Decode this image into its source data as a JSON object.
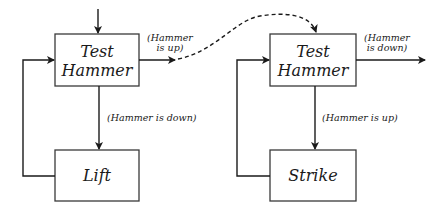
{
  "diagram": {
    "left": {
      "test_box": {
        "line1": "Test",
        "line2": "Hammer"
      },
      "action_box": {
        "label": "Lift"
      },
      "exit_label": {
        "line1": "(Hammer",
        "line2": "is up)"
      },
      "down_label": "(Hammer is down)"
    },
    "right": {
      "test_box": {
        "line1": "Test",
        "line2": "Hammer"
      },
      "action_box": {
        "label": "Strike"
      },
      "exit_label": {
        "line1": "(Hammer",
        "line2": "is down)"
      },
      "down_label": "(Hammer is up)"
    },
    "colors": {
      "ink": "#1a1a1a",
      "background": "#ffffff"
    }
  }
}
